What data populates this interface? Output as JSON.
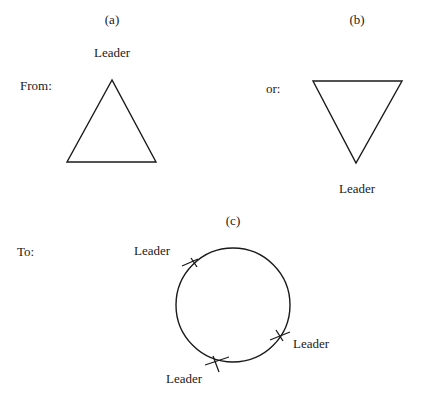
{
  "figure": {
    "panels": [
      {
        "id": "a",
        "label": "(a)",
        "prefix": "From:",
        "shape": "triangle-up",
        "leader_label": "Leader",
        "leader_position": "top vertex"
      },
      {
        "id": "b",
        "label": "(b)",
        "prefix": "or:",
        "shape": "triangle-down",
        "leader_label": "Leader",
        "leader_position": "bottom vertex"
      },
      {
        "id": "c",
        "label": "(c)",
        "prefix": "To:",
        "shape": "ring",
        "leaders": [
          {
            "label": "Leader",
            "position": "upper-left"
          },
          {
            "label": "Leader",
            "position": "lower-right"
          },
          {
            "label": "Leader",
            "position": "bottom"
          }
        ]
      }
    ]
  }
}
